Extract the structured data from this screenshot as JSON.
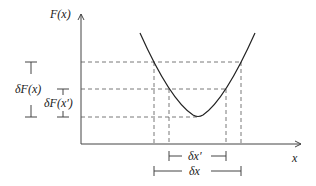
{
  "labels": {
    "y_axis": "F(x)",
    "x_axis": "x",
    "delta_F_x": "δF(x)",
    "delta_F_xp": "δF(x′)",
    "delta_xp": "δx′",
    "delta_x": "δx"
  },
  "colors": {
    "line": "#222222",
    "dash": "#555555"
  }
}
